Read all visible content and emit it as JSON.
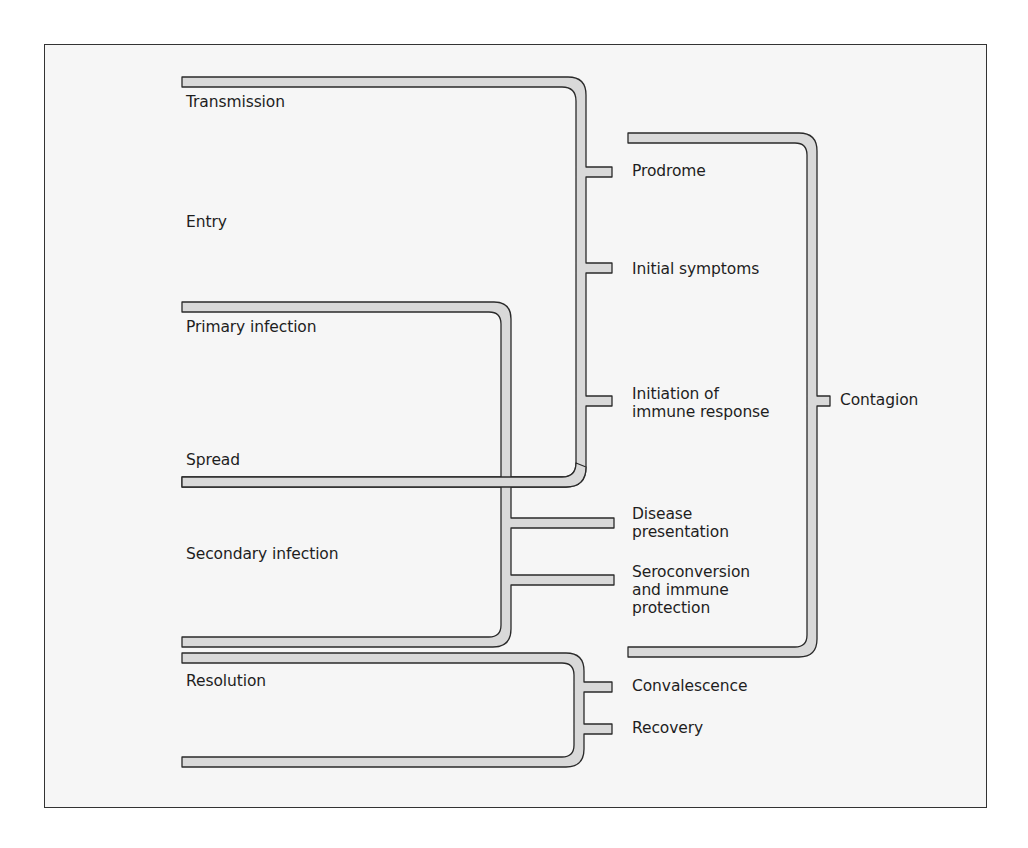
{
  "diagram": {
    "colors": {
      "frame_border": "#333333",
      "frame_background": "#f6f6f6",
      "bracket_fill": "#d9d9d9",
      "bracket_stroke": "#2a2a2a",
      "text": "#1e1e1e"
    },
    "stages_left": [
      {
        "id": "transmission",
        "label": "Transmission"
      },
      {
        "id": "entry",
        "label": "Entry"
      },
      {
        "id": "primary_infection",
        "label": "Primary infection"
      },
      {
        "id": "spread",
        "label": "Spread"
      },
      {
        "id": "secondary_infection",
        "label": "Secondary infection"
      },
      {
        "id": "resolution",
        "label": "Resolution"
      }
    ],
    "stages_middle": [
      {
        "id": "prodrome",
        "label": "Prodrome"
      },
      {
        "id": "initial_symptoms",
        "label": "Initial symptoms"
      },
      {
        "id": "initiation_immune",
        "label_line1": "Initiation of",
        "label_line2": "immune response"
      },
      {
        "id": "disease_presentation",
        "label_line1": "Disease",
        "label_line2": "presentation"
      },
      {
        "id": "seroconversion",
        "label_line1": "Seroconversion",
        "label_line2": "and immune",
        "label_line3": "protection"
      },
      {
        "id": "convalescence",
        "label": "Convalescence"
      },
      {
        "id": "recovery",
        "label": "Recovery"
      }
    ],
    "stages_right": [
      {
        "id": "contagion",
        "label": "Contagion"
      }
    ],
    "brackets": [
      {
        "id": "bracket-transmission-spread",
        "spans": [
          "Transmission",
          "Spread"
        ],
        "maps_to": [
          "Prodrome",
          "Initial symptoms",
          "Initiation of immune response"
        ]
      },
      {
        "id": "bracket-primary-secondary",
        "spans": [
          "Primary infection",
          "Secondary infection"
        ],
        "maps_to": [
          "Disease presentation",
          "Seroconversion and immune protection"
        ]
      },
      {
        "id": "bracket-resolution",
        "spans": [
          "Resolution"
        ],
        "maps_to": [
          "Convalescence",
          "Recovery"
        ]
      },
      {
        "id": "bracket-contagion",
        "spans": [
          "Prodrome",
          "Seroconversion and immune protection"
        ],
        "maps_to": [
          "Contagion"
        ]
      }
    ]
  }
}
